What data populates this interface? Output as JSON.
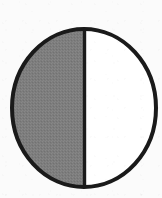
{
  "canvas": {
    "width": 162,
    "height": 198,
    "background_color": "#fbfbfb",
    "paper_texture": "scanned-grain"
  },
  "figure": {
    "name": "half-shaded-circle",
    "shape": "circle",
    "outline_color": "#1a1a1a",
    "outline_width": 4,
    "center_x": 84,
    "center_y": 108,
    "radius_x": 72,
    "radius_y": 79,
    "bounds": {
      "left": 12,
      "top": 29,
      "right": 156,
      "bottom": 187
    }
  },
  "divider": {
    "name": "vertical-diameter",
    "orientation": "vertical",
    "x": 84,
    "y_top": 29,
    "y_bottom": 187,
    "color": "#1a1a1a",
    "width": 3
  },
  "halves": [
    {
      "id": "left-half",
      "position": "left",
      "state": "shaded",
      "fill_color": "#7d7d7d",
      "fill_texture": "dithered-gray",
      "fraction": "1/2"
    },
    {
      "id": "right-half",
      "position": "right",
      "state": "unshaded",
      "fill_color": "#ffffff",
      "fill_texture": "none",
      "fraction": "1/2"
    }
  ],
  "colors": {
    "ink": "#1a1a1a",
    "shade": "#7d7d7d",
    "blank": "#ffffff",
    "paper": "#fbfbfb"
  },
  "labels": {
    "text_present": false
  }
}
